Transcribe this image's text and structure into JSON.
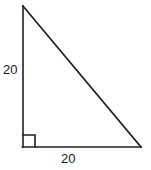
{
  "figure": {
    "type": "right-triangle-diagram",
    "background_color": "#ffffff",
    "stroke_color": "#231f20",
    "label_color": "#1a1a1a",
    "labels": {
      "vertical_leg": "20",
      "horizontal_leg": "20"
    },
    "geometry": {
      "apex_point": "23,6",
      "right_angle_point": "23,147",
      "base_point": "141,147",
      "right_angle_marker_size": 12
    },
    "icons": {
      "right_angle_marker": "right-angle-icon"
    }
  }
}
